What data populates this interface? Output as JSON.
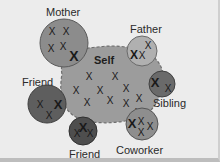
{
  "diagram": {
    "colors": {
      "background": "#ececec",
      "self_fill": "#9c9c9c",
      "mother_fill": "#8c8c8c",
      "father_fill": "#b0b0b0",
      "friend_left_fill": "#5e5e5e",
      "friend_bottom_fill": "#4e4e4e",
      "sibling_fill": "#6a6a6a",
      "coworker_fill": "#8e8e8e"
    },
    "nodes": [
      {
        "id": "self",
        "label": "Self",
        "x_marks": 10
      },
      {
        "id": "mother",
        "label": "Mother",
        "x_marks": 5
      },
      {
        "id": "father",
        "label": "Father",
        "x_marks": 3
      },
      {
        "id": "friend-left",
        "label": "Friend",
        "x_marks": 3
      },
      {
        "id": "friend-bottom",
        "label": "Friend",
        "x_marks": 3
      },
      {
        "id": "sibling",
        "label": "Sibling",
        "x_marks": 2
      },
      {
        "id": "coworker",
        "label": "Coworker",
        "x_marks": 4
      }
    ],
    "mark_glyph": "X"
  }
}
